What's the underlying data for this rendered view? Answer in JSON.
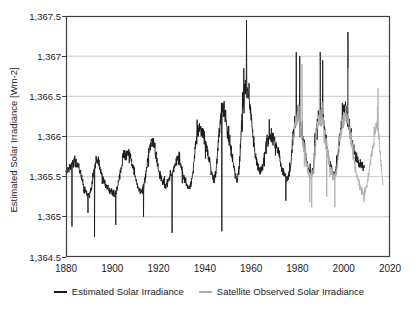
{
  "chart_data": {
    "type": "line",
    "title": "",
    "xlabel": "",
    "ylabel": "Estimated Solar Irradiance [Wm-2]",
    "xlim": [
      1880,
      2020
    ],
    "ylim": [
      1364.5,
      1367.5
    ],
    "x_ticks": [
      1880,
      1900,
      1920,
      1940,
      1960,
      1980,
      2000,
      2020
    ],
    "x_tick_labels": [
      "1880",
      "1900",
      "1920",
      "1940",
      "1960",
      "1980",
      "2000",
      "2020"
    ],
    "y_ticks": [
      1364.5,
      1365,
      1365.5,
      1366,
      1366.5,
      1367,
      1367.5
    ],
    "y_tick_labels": [
      "1,364.5",
      "1,365",
      "1,365.5",
      "1,366",
      "1,366.5",
      "1,367",
      "1,367.5"
    ],
    "grid": "horizontal-only",
    "legend_position": "bottom-center",
    "colors": {
      "grid": "#c9c9c9",
      "axis": "#3d3d3d",
      "background": "#ffffff"
    },
    "noise": {
      "base_amplitude": 0.055,
      "peak_amplitude_factor": 0.1,
      "spike_probability": 0.07,
      "spike_multiplier": 2.6
    },
    "series": [
      {
        "name": "Estimated Solar Irradiance",
        "id": "estimated",
        "color": "#1b1b1b",
        "start_year": 1880,
        "end_year": 2009,
        "annual_values": [
          1365.55,
          1365.6,
          1365.62,
          1365.66,
          1365.7,
          1365.66,
          1365.58,
          1365.45,
          1365.35,
          1365.28,
          1365.26,
          1365.35,
          1365.55,
          1365.72,
          1365.7,
          1365.58,
          1365.48,
          1365.4,
          1365.35,
          1365.32,
          1365.3,
          1365.28,
          1365.32,
          1365.5,
          1365.65,
          1365.78,
          1365.75,
          1365.8,
          1365.72,
          1365.6,
          1365.48,
          1365.38,
          1365.32,
          1365.32,
          1365.42,
          1365.65,
          1365.85,
          1365.95,
          1365.9,
          1365.75,
          1365.58,
          1365.48,
          1365.42,
          1365.38,
          1365.42,
          1365.5,
          1365.55,
          1365.65,
          1365.72,
          1365.7,
          1365.6,
          1365.48,
          1365.4,
          1365.35,
          1365.42,
          1365.6,
          1365.9,
          1366.08,
          1366.12,
          1366.05,
          1365.95,
          1365.85,
          1365.7,
          1365.55,
          1365.45,
          1365.6,
          1366.0,
          1366.3,
          1366.35,
          1366.25,
          1366.05,
          1365.9,
          1365.72,
          1365.55,
          1365.45,
          1365.65,
          1366.2,
          1366.6,
          1366.65,
          1366.5,
          1366.25,
          1365.95,
          1365.72,
          1365.62,
          1365.58,
          1365.62,
          1365.8,
          1365.95,
          1366.0,
          1366.0,
          1365.95,
          1365.85,
          1365.8,
          1365.62,
          1365.55,
          1365.48,
          1365.48,
          1365.6,
          1365.95,
          1366.2,
          1366.28,
          1366.25,
          1366.0,
          1365.88,
          1365.68,
          1365.55,
          1365.5,
          1365.6,
          1366.0,
          1366.28,
          1366.28,
          1366.28,
          1366.02,
          1365.82,
          1365.68,
          1365.56,
          1365.5,
          1365.6,
          1365.95,
          1366.12,
          1366.28,
          1366.32,
          1366.22,
          1366.02,
          1365.88,
          1365.76,
          1365.7,
          1365.66,
          1365.62,
          1365.66
        ],
        "spikes": [
          [
            1882.6,
            1364.88
          ],
          [
            1889.5,
            1365.05
          ],
          [
            1892.3,
            1364.75
          ],
          [
            1901.5,
            1364.9
          ],
          [
            1913.5,
            1365.0
          ],
          [
            1925.8,
            1364.8
          ],
          [
            1947.3,
            1364.82
          ],
          [
            1958.0,
            1367.45
          ],
          [
            1975.0,
            1365.2
          ],
          [
            1979.5,
            1367.05
          ],
          [
            1981.0,
            1367.0
          ],
          [
            1989.8,
            1367.05
          ],
          [
            1990.9,
            1366.95
          ],
          [
            2001.8,
            1367.3
          ]
        ]
      },
      {
        "name": "Satellite Observed Solar Irradiance",
        "id": "satellite",
        "color": "#b0b0b0",
        "start_year": 1978,
        "end_year": 2017,
        "annual_values": [
          1365.9,
          1366.15,
          1366.22,
          1366.18,
          1365.95,
          1365.85,
          1365.66,
          1365.54,
          1365.48,
          1365.58,
          1365.98,
          1366.24,
          1366.2,
          1366.24,
          1365.98,
          1365.8,
          1365.66,
          1365.55,
          1365.48,
          1365.58,
          1365.92,
          1366.08,
          1366.22,
          1366.28,
          1366.2,
          1365.98,
          1365.8,
          1365.62,
          1365.48,
          1365.38,
          1365.3,
          1365.26,
          1365.38,
          1365.58,
          1365.78,
          1365.95,
          1366.18,
          1366.08,
          1365.72,
          1365.4
        ],
        "spikes": [
          [
            1982.0,
            1366.9
          ],
          [
            1985.3,
            1365.18
          ],
          [
            1986.2,
            1365.12
          ],
          [
            1989.5,
            1367.0
          ],
          [
            1992.7,
            1365.25
          ],
          [
            1996.2,
            1365.12
          ],
          [
            2002.0,
            1366.85
          ],
          [
            2014.8,
            1366.6
          ]
        ]
      }
    ]
  }
}
